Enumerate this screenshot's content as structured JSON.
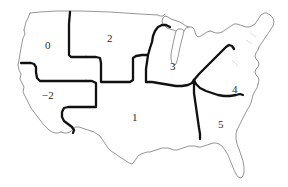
{
  "figure": {
    "kind": "choropleth-outline-map",
    "background_color": "#ffffff",
    "outline_color": "#8a8a8a",
    "divider_color": "#000000",
    "label_color": "#2b2b2b"
  },
  "regions": [
    {
      "id": "region-0",
      "label": "0",
      "x": 48,
      "y": 45,
      "name": "pacific-northwest-region"
    },
    {
      "id": "region-2",
      "label": "2",
      "x": 110,
      "y": 38,
      "name": "northern-plains-region"
    },
    {
      "id": "region-minus2",
      "label": "−2",
      "x": 48,
      "y": 95,
      "name": "southwest-region"
    },
    {
      "id": "region-1",
      "label": "1",
      "x": 135,
      "y": 117,
      "name": "central-south-region"
    },
    {
      "id": "region-3",
      "label": "3",
      "x": 173,
      "y": 66,
      "name": "great-lakes-region"
    },
    {
      "id": "region-4",
      "label": "4",
      "x": 235,
      "y": 89,
      "name": "southeast-atlantic-region"
    },
    {
      "id": "region-5",
      "label": "5",
      "x": 221,
      "y": 124,
      "name": "deep-south-region"
    }
  ],
  "geography": {
    "national_outline": "M 30,62 L 30.5,70 L 28,76 L 29,82 L 27,86 L 29,92 L 28,98 L 31,104 L 33,110 L 36,116 L 40,122 L 44,126 L 48,130 L 52,133 L 56,134 L 60,133 L 62,131 L 66,133 L 70,136 L 74,138 L 78,140 L 80,143 L 82,147 L 86,150 L 90,152 L 96,154 L 102,155 L 108,155 L 112,152 L 116,150 L 120,150 L 124,153 L 128,157 L 132,161 L 136,165 L 140,168 L 143,167 L 145,163 L 147,158 L 150,154 L 154,152 L 158,151 L 162,150 L 166,148 L 170,147 L 174,148 L 178,149 L 182,148 L 186,146 L 190,145 L 194,146 L 198,146 L 202,145 L 206,144 L 210,143 L 214,142 L 218,142 L 222,143 L 226,146 L 230,152 L 233,158 L 236,164 L 238,170 L 240,174 L 243,176 L 246,174 L 248,169 L 249,163 L 248,156 L 246,149 L 244,143 L 242,137 L 241,131 L 242,126 L 244,121 L 246,117 L 249,113 L 252,108 L 254,103 L 255,98 L 256,93 L 258,88 L 260,83 L 262,78 L 264,73 L 266,68 L 268,63 L 269,58 L 270,52 L 272,47 L 274,42 L 276,37 L 277,31 L 276,25 L 273,20 L 269,17 L 265,16 L 261,18 L 258,22 L 256,27 L 253,31 L 249,33 L 245,33 L 241,31 L 237,28 L 233,25 L 229,23 L 225,22 L 221,23 L 217,25 L 213,27 L 209,28 L 205,27 L 201,25 L 197,23 L 193,21 L 189,20 L 185,20 L 181,21 L 177,22 L 173,21 L 169,19 L 165,17 L 161,16 L 157,16 L 153,17 L 149,17 L 145,16 L 141,15 L 137,14 L 133,13 L 129,13 L 125,12 L 121,12 L 117,11 L 113,11 L 109,10 L 105,10 L 101,9 L 97,9 L 93,8 L 89,8 L 85,7 L 81,7 L 77,6 L 73,6 L 69,6 L 65,7 L 61,8 L 57,9 L 53,10 L 49,11 L 45,12 L 41,13 L 38,15 L 36,19 L 35,24 L 33,28 L 32,32 L 34,35 L 33,39 L 31,43 L 30,48 L 30,54 Z",
    "state_detail_present": true,
    "great_lakes_present": true,
    "florida_present": true
  }
}
